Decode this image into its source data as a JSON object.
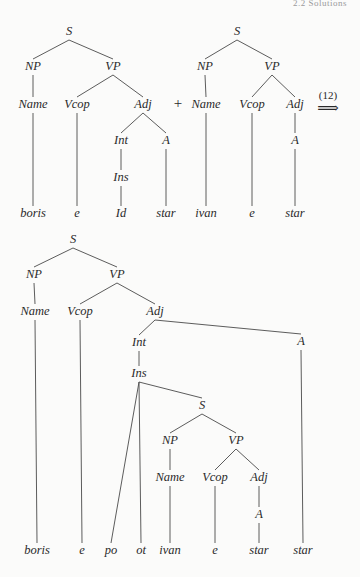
{
  "page": {
    "header": "2.2 Solutions"
  },
  "operator": {
    "plus": "+",
    "rule_number": "(12)",
    "arrow": "⟹"
  },
  "tree_left": {
    "nodes": [
      {
        "id": "S",
        "label": "S",
        "x": 69,
        "y": 32
      },
      {
        "id": "NP",
        "label": "NP",
        "x": 33,
        "y": 67
      },
      {
        "id": "VP",
        "label": "VP",
        "x": 113,
        "y": 67
      },
      {
        "id": "Name",
        "label": "Name",
        "x": 33,
        "y": 105
      },
      {
        "id": "Vcop",
        "label": "Vcop",
        "x": 77,
        "y": 105
      },
      {
        "id": "Adj",
        "label": "Adj",
        "x": 143,
        "y": 105
      },
      {
        "id": "Int",
        "label": "Int",
        "x": 121,
        "y": 141
      },
      {
        "id": "A",
        "label": "A",
        "x": 166,
        "y": 141
      },
      {
        "id": "Ins",
        "label": "Ins",
        "x": 121,
        "y": 178
      },
      {
        "id": "w_boris",
        "label": "boris",
        "x": 33,
        "y": 214
      },
      {
        "id": "w_e",
        "label": "e",
        "x": 77,
        "y": 214
      },
      {
        "id": "w_Id",
        "label": "Id",
        "x": 121,
        "y": 214
      },
      {
        "id": "w_star",
        "label": "star",
        "x": 166,
        "y": 214
      }
    ],
    "edges": [
      [
        "S",
        "NP"
      ],
      [
        "S",
        "VP"
      ],
      [
        "NP",
        "Name"
      ],
      [
        "VP",
        "Vcop"
      ],
      [
        "VP",
        "Adj"
      ],
      [
        "Adj",
        "Int"
      ],
      [
        "Adj",
        "A"
      ],
      [
        "Int",
        "Ins"
      ],
      [
        "Ins",
        "w_Id"
      ],
      [
        "Name",
        "w_boris"
      ],
      [
        "Vcop",
        "w_e"
      ],
      [
        "A",
        "w_star"
      ]
    ]
  },
  "tree_right": {
    "nodes": [
      {
        "id": "S",
        "label": "S",
        "x": 237,
        "y": 32
      },
      {
        "id": "NP",
        "label": "NP",
        "x": 205,
        "y": 67
      },
      {
        "id": "VP",
        "label": "VP",
        "x": 272,
        "y": 67
      },
      {
        "id": "Name",
        "label": "Name",
        "x": 206,
        "y": 105
      },
      {
        "id": "Vcop",
        "label": "Vcop",
        "x": 252,
        "y": 105
      },
      {
        "id": "Adj",
        "label": "Adj",
        "x": 295,
        "y": 105
      },
      {
        "id": "A",
        "label": "A",
        "x": 295,
        "y": 141
      },
      {
        "id": "w_ivan",
        "label": "ivan",
        "x": 206,
        "y": 214
      },
      {
        "id": "w_e",
        "label": "e",
        "x": 252,
        "y": 214
      },
      {
        "id": "w_star",
        "label": "star",
        "x": 295,
        "y": 214
      }
    ],
    "edges": [
      [
        "S",
        "NP"
      ],
      [
        "S",
        "VP"
      ],
      [
        "NP",
        "Name"
      ],
      [
        "VP",
        "Vcop"
      ],
      [
        "VP",
        "Adj"
      ],
      [
        "Adj",
        "A"
      ],
      [
        "Name",
        "w_ivan"
      ],
      [
        "Vcop",
        "w_e"
      ],
      [
        "A",
        "w_star"
      ]
    ]
  },
  "tree_result": {
    "nodes": [
      {
        "id": "S",
        "label": "S",
        "x": 73,
        "y": 240
      },
      {
        "id": "NP",
        "label": "NP",
        "x": 34,
        "y": 275
      },
      {
        "id": "VP",
        "label": "VP",
        "x": 117,
        "y": 275
      },
      {
        "id": "Name",
        "label": "Name",
        "x": 35,
        "y": 312
      },
      {
        "id": "Vcop",
        "label": "Vcop",
        "x": 80,
        "y": 312
      },
      {
        "id": "Adj",
        "label": "Adj",
        "x": 155,
        "y": 312
      },
      {
        "id": "Int",
        "label": "Int",
        "x": 139,
        "y": 343
      },
      {
        "id": "A",
        "label": "A",
        "x": 301,
        "y": 342
      },
      {
        "id": "Ins",
        "label": "Ins",
        "x": 139,
        "y": 374
      },
      {
        "id": "S2",
        "label": "S",
        "x": 202,
        "y": 406
      },
      {
        "id": "NP2",
        "label": "NP",
        "x": 170,
        "y": 441
      },
      {
        "id": "VP2",
        "label": "VP",
        "x": 236,
        "y": 441
      },
      {
        "id": "Name2",
        "label": "Name",
        "x": 170,
        "y": 478
      },
      {
        "id": "Vcop2",
        "label": "Vcop",
        "x": 215,
        "y": 478
      },
      {
        "id": "Adj2",
        "label": "Adj",
        "x": 259,
        "y": 478
      },
      {
        "id": "A2",
        "label": "A",
        "x": 259,
        "y": 515
      },
      {
        "id": "w_boris",
        "label": "boris",
        "x": 37,
        "y": 551
      },
      {
        "id": "w_e1",
        "label": "e",
        "x": 82,
        "y": 551
      },
      {
        "id": "w_po",
        "label": "po",
        "x": 111,
        "y": 551
      },
      {
        "id": "w_ot",
        "label": "ot",
        "x": 141,
        "y": 551
      },
      {
        "id": "w_ivan",
        "label": "ivan",
        "x": 170,
        "y": 551
      },
      {
        "id": "w_e2",
        "label": "e",
        "x": 215,
        "y": 551
      },
      {
        "id": "w_star1",
        "label": "star",
        "x": 259,
        "y": 551
      },
      {
        "id": "w_star2",
        "label": "star",
        "x": 303,
        "y": 551
      }
    ],
    "edges": [
      [
        "S",
        "NP"
      ],
      [
        "S",
        "VP"
      ],
      [
        "NP",
        "Name"
      ],
      [
        "VP",
        "Vcop"
      ],
      [
        "VP",
        "Adj"
      ],
      [
        "Adj",
        "Int"
      ],
      [
        "Adj",
        "A"
      ],
      [
        "Int",
        "Ins"
      ],
      [
        "Ins",
        "w_po"
      ],
      [
        "Ins",
        "w_ot"
      ],
      [
        "Ins",
        "S2"
      ],
      [
        "S2",
        "NP2"
      ],
      [
        "S2",
        "VP2"
      ],
      [
        "NP2",
        "Name2"
      ],
      [
        "VP2",
        "Vcop2"
      ],
      [
        "VP2",
        "Adj2"
      ],
      [
        "Adj2",
        "A2"
      ],
      [
        "Name2",
        "w_ivan"
      ],
      [
        "Vcop2",
        "w_e2"
      ],
      [
        "A2",
        "w_star1"
      ],
      [
        "Name",
        "w_boris"
      ],
      [
        "Vcop",
        "w_e1"
      ],
      [
        "A",
        "w_star2"
      ]
    ]
  }
}
